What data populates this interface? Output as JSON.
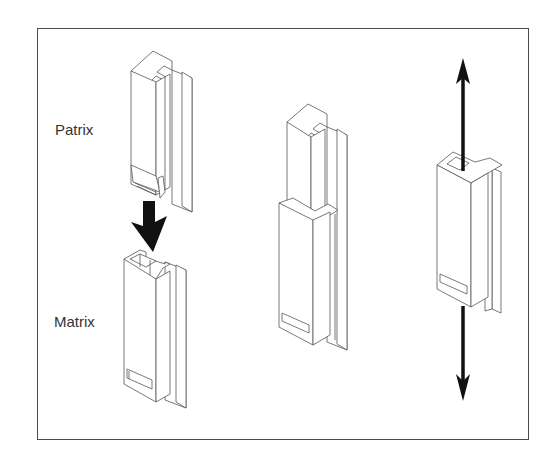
{
  "figure": {
    "labels": {
      "patrix": "Patrix",
      "matrix": "Matrix"
    },
    "panels": [
      {
        "id": "separated",
        "description": "Patrix above Matrix with downward insertion arrow"
      },
      {
        "id": "engaged",
        "description": "Patrix inserted into Matrix"
      },
      {
        "id": "loaded",
        "description": "Assembled attachment with bidirectional vertical arrow"
      }
    ],
    "colors": {
      "line": "#555555",
      "arrow": "#111111",
      "frame": "#4a4a4a",
      "background": "#ffffff"
    }
  }
}
